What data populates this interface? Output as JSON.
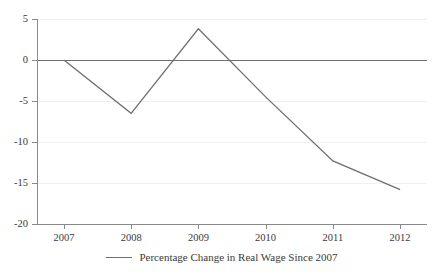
{
  "chart_data": {
    "type": "line",
    "title": "",
    "xlabel": "",
    "ylabel": "",
    "categories": [
      "2007",
      "2008",
      "2009",
      "2010",
      "2011",
      "2012"
    ],
    "x": [
      2007,
      2008,
      2009,
      2010,
      2011,
      2012
    ],
    "series": [
      {
        "name": "Percentage Change in Real Wage Since 2007",
        "values": [
          0,
          -6.5,
          3.8,
          -4.5,
          -12.3,
          -15.8
        ],
        "color": "#6f6f6f"
      }
    ],
    "ylim": [
      -20,
      5
    ],
    "xlim": [
      2006.6,
      2012.4
    ],
    "yticks": [
      5,
      0,
      -5,
      -10,
      -15,
      -20
    ],
    "ytick_labels": [
      "5",
      "0",
      "-5",
      "-10",
      "-15",
      "-20"
    ],
    "xticks": [
      2007,
      2008,
      2009,
      2010,
      2011,
      2012
    ],
    "xtick_labels": [
      "2007",
      "2008",
      "2009",
      "2010",
      "2011",
      "2012"
    ],
    "grid": true,
    "grid_color": "#f0f0f0",
    "zero_line": true,
    "zero_line_color": "#6f6f6f",
    "axis_color": "#8a8a8a",
    "legend_position": "bottom-center"
  },
  "legend": {
    "entries": [
      {
        "label": "Percentage Change in Real Wage Since 2007"
      }
    ]
  }
}
